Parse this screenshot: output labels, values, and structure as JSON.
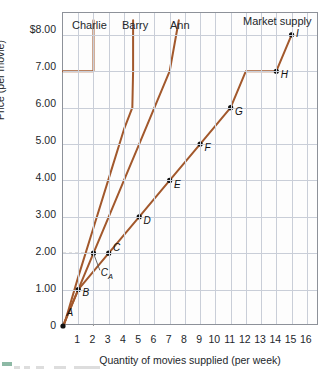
{
  "chart_data": {
    "type": "line",
    "title": "",
    "xlabel": "Quantity of movies supplied (per week)",
    "ylabel": "Price (per movie)",
    "xlim": [
      0,
      16.8
    ],
    "ylim": [
      0,
      8.6
    ],
    "grid": true,
    "xticks": [
      "1",
      "2",
      "3",
      "4",
      "5",
      "6",
      "7",
      "8",
      "9",
      "10",
      "11",
      "12",
      "13",
      "14",
      "15",
      "16"
    ],
    "yticks": [
      "$8.00",
      "7.00",
      "6.00",
      "5.00",
      "4.00",
      "3.00",
      "2.00",
      "1.00",
      "0"
    ],
    "ytick_values": [
      8,
      7,
      6,
      5,
      4,
      3,
      2,
      1,
      0
    ],
    "legend_position": "inline-above-curves",
    "series": [
      {
        "name": "Ann",
        "label": "Ann",
        "label_x": 7.0,
        "label_y": 8.45,
        "color": "#A2582C",
        "points": [
          [
            0,
            0
          ],
          [
            1,
            1
          ],
          [
            2,
            2
          ],
          [
            3,
            3
          ],
          [
            4,
            4
          ],
          [
            5,
            5
          ],
          [
            6,
            6
          ],
          [
            7,
            7
          ],
          [
            7.6,
            8.4
          ]
        ],
        "x": [
          0,
          1,
          2,
          2,
          3,
          4,
          5,
          6,
          7,
          7.6
        ],
        "y": [
          0,
          1,
          2,
          2,
          3,
          4,
          5,
          6,
          7,
          8.4
        ]
      },
      {
        "name": "Barry",
        "label": "Barry",
        "label_x": 4.0,
        "label_y": 8.45,
        "color": "#A2582C",
        "x": [
          0.05,
          1,
          2,
          3,
          4,
          4.55,
          4.6,
          4.6
        ],
        "y": [
          0,
          1.35,
          2.7,
          4.05,
          5.4,
          6.0,
          7.0,
          8.4
        ]
      },
      {
        "name": "Charlie",
        "label": "Charlie",
        "label_x": 1.55,
        "label_y": 8.45,
        "color": "#A2582C",
        "x": [
          0,
          2.0,
          2.0
        ],
        "y": [
          7,
          7,
          8.4
        ]
      },
      {
        "name": "Market supply",
        "label": "Market supply",
        "label_x": 13.6,
        "label_y": 8.5,
        "color": "#A2582C",
        "x": [
          0,
          1,
          3,
          5,
          7,
          9,
          11,
          12,
          14,
          15
        ],
        "y": [
          0,
          1,
          2,
          3,
          4,
          5,
          6,
          7,
          7,
          8
        ]
      }
    ],
    "annotations": [
      {
        "label": "A",
        "x": 0,
        "y": 0,
        "dot": true,
        "lx": 0.3,
        "ly": 0.32,
        "series": "Ann"
      },
      {
        "label": "B",
        "x": 1,
        "y": 1,
        "dot": true,
        "lx": 1.35,
        "ly": 0.88,
        "series": "Market supply"
      },
      {
        "label": "C_A",
        "x": 2,
        "y": 2,
        "dot": true,
        "lx": 2.55,
        "ly": 1.42,
        "series": "Ann",
        "leader": true
      },
      {
        "label": "C",
        "x": 3,
        "y": 2,
        "dot": true,
        "lx": 3.35,
        "ly": 2.12,
        "series": "Market supply"
      },
      {
        "label": "D",
        "x": 5,
        "y": 3,
        "dot": true,
        "lx": 5.35,
        "ly": 2.85,
        "series": "Market supply"
      },
      {
        "label": "E",
        "x": 7,
        "y": 4,
        "dot": true,
        "lx": 7.35,
        "ly": 3.85,
        "series": "Market supply"
      },
      {
        "label": "F",
        "x": 9,
        "y": 5,
        "dot": true,
        "lx": 9.35,
        "ly": 4.85,
        "series": "Market supply"
      },
      {
        "label": "G",
        "x": 11,
        "y": 6,
        "dot": true,
        "lx": 11.35,
        "ly": 5.85,
        "series": "Market supply"
      },
      {
        "label": "H",
        "x": 14,
        "y": 7,
        "dot": true,
        "lx": 14.35,
        "ly": 6.88,
        "series": "Market supply"
      },
      {
        "label": "I",
        "x": 15,
        "y": 8,
        "dot": true,
        "lx": 15.35,
        "ly": 8.0,
        "series": "Market supply"
      }
    ],
    "guide_lines": [
      {
        "type": "dashed-vertical",
        "x": 2,
        "y_from": 0,
        "y_to": 2
      },
      {
        "type": "dashed-horizontal",
        "y": 2,
        "x_from": 0,
        "x_to": 2
      }
    ]
  }
}
